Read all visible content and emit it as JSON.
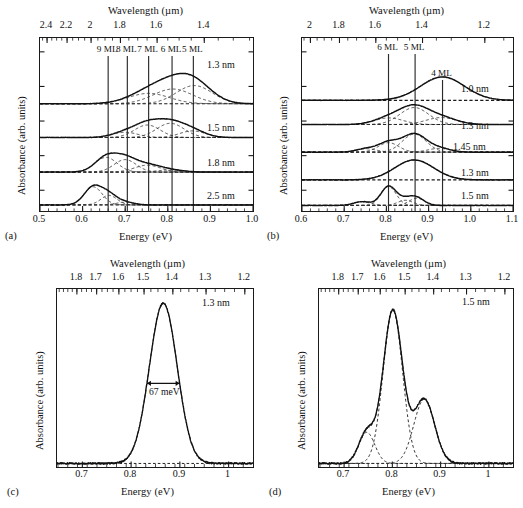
{
  "figure": {
    "axis_titles": {
      "wavelength": "Wavelength (µm)",
      "energy": "Energy (eV)",
      "absorbance": "Absorbance (arb. units)"
    },
    "panel_labels": {
      "a": "(a)",
      "b": "(b)",
      "c": "(c)",
      "d": "(d)"
    }
  },
  "chart_data": [
    {
      "panel": "a",
      "type": "line",
      "title": "",
      "xlabel": "Energy (eV)",
      "ylabel": "Absorbance (arb. units)",
      "top_axis_label": "Wavelength (µm)",
      "xlim": [
        0.5,
        1.0
      ],
      "xticks": [
        0.5,
        0.6,
        0.7,
        0.8,
        0.9,
        1.0
      ],
      "xticklabels": [
        "0.5",
        "0.6",
        "0.7",
        "0.8",
        "0.9",
        "1.0"
      ],
      "top_ticks_um": [
        2.4,
        2.2,
        2.0,
        1.8,
        1.6,
        1.4
      ],
      "top_ticklabels": [
        "2.4",
        "2.2",
        "2",
        "1.8",
        "1.6",
        "1.4"
      ],
      "grid": false,
      "legend_position": "right-inline",
      "marker_lines": [
        {
          "label": "9 ML",
          "energy": 0.66
        },
        {
          "label": "8 ML",
          "energy": 0.705
        },
        {
          "label": "7 ML",
          "energy": 0.755
        },
        {
          "label": "6 ML",
          "energy": 0.81
        },
        {
          "label": "5 ML",
          "energy": 0.86
        }
      ],
      "series": [
        {
          "name": "1.3 nm",
          "label": "1.3 nm",
          "baseline": 0.62,
          "components": [
            {
              "center": 0.755,
              "sigma": 0.048,
              "amp": 0.06
            },
            {
              "center": 0.812,
              "sigma": 0.046,
              "amp": 0.085
            },
            {
              "center": 0.862,
              "sigma": 0.042,
              "amp": 0.105
            }
          ]
        },
        {
          "name": "1.5 nm",
          "label": "1.5 nm",
          "baseline": 0.425,
          "components": [
            {
              "center": 0.7,
              "sigma": 0.03,
              "amp": 0.03
            },
            {
              "center": 0.752,
              "sigma": 0.03,
              "amp": 0.072
            },
            {
              "center": 0.806,
              "sigma": 0.032,
              "amp": 0.082
            },
            {
              "center": 0.858,
              "sigma": 0.03,
              "amp": 0.038
            }
          ]
        },
        {
          "name": "1.8 nm",
          "label": "1.8 nm",
          "baseline": 0.225,
          "components": [
            {
              "center": 0.655,
              "sigma": 0.026,
              "amp": 0.085
            },
            {
              "center": 0.7,
              "sigma": 0.026,
              "amp": 0.072
            },
            {
              "center": 0.752,
              "sigma": 0.03,
              "amp": 0.04
            },
            {
              "center": 0.805,
              "sigma": 0.03,
              "amp": 0.012
            }
          ]
        },
        {
          "name": "2.5 nm",
          "label": "2.5 nm",
          "baseline": 0.035,
          "components": [
            {
              "center": 0.625,
              "sigma": 0.021,
              "amp": 0.105
            },
            {
              "center": 0.662,
              "sigma": 0.019,
              "amp": 0.055
            },
            {
              "center": 0.7,
              "sigma": 0.02,
              "amp": 0.016
            }
          ]
        }
      ]
    },
    {
      "panel": "b",
      "type": "line",
      "title": "",
      "xlabel": "Energy (eV)",
      "ylabel": "Absorbance (arb. units)",
      "top_axis_label": "Wavelength (µm)",
      "xlim": [
        0.6,
        1.1
      ],
      "xticks": [
        0.6,
        0.7,
        0.8,
        0.9,
        1.0,
        1.1
      ],
      "xticklabels": [
        "0.6",
        "0.7",
        "0.8",
        "0.9",
        "1.0",
        "1.1"
      ],
      "top_ticks_um": [
        2.0,
        1.8,
        1.6,
        1.4,
        1.2
      ],
      "top_ticklabels": [
        "2",
        "1.8",
        "1.6",
        "1.4",
        "1.2"
      ],
      "grid": false,
      "legend_position": "right-inline",
      "marker_lines": [
        {
          "label": "6 ML",
          "energy": 0.805
        },
        {
          "label": "5 ML",
          "energy": 0.868
        },
        {
          "label": "4 ML",
          "energy": 0.933
        }
      ],
      "series": [
        {
          "name": "1.0 nm",
          "label": "1.0 nm",
          "baseline": 0.64,
          "components": [
            {
              "center": 0.933,
              "sigma": 0.052,
              "amp": 0.135
            }
          ]
        },
        {
          "name": "1.3 nm",
          "label": "1.3 nm",
          "baseline": 0.5,
          "components": [
            {
              "center": 0.806,
              "sigma": 0.034,
              "amp": 0.038
            },
            {
              "center": 0.866,
              "sigma": 0.034,
              "amp": 0.098
            },
            {
              "center": 0.93,
              "sigma": 0.036,
              "amp": 0.04
            }
          ]
        },
        {
          "name": "1.45 nm",
          "label": "1.45 nm",
          "baseline": 0.34,
          "components": [
            {
              "center": 0.752,
              "sigma": 0.024,
              "amp": 0.02
            },
            {
              "center": 0.805,
              "sigma": 0.024,
              "amp": 0.055
            },
            {
              "center": 0.866,
              "sigma": 0.028,
              "amp": 0.105
            },
            {
              "center": 0.925,
              "sigma": 0.026,
              "amp": 0.022
            }
          ]
        },
        {
          "name": "1.3 nm (lower)",
          "label": "1.3 nm",
          "baseline": 0.18,
          "components": [
            {
              "center": 0.866,
              "sigma": 0.046,
              "amp": 0.115
            }
          ]
        },
        {
          "name": "1.5 nm",
          "label": "1.5 nm",
          "baseline": 0.032,
          "components": [
            {
              "center": 0.742,
              "sigma": 0.02,
              "amp": 0.022
            },
            {
              "center": 0.805,
              "sigma": 0.018,
              "amp": 0.11
            },
            {
              "center": 0.845,
              "sigma": 0.018,
              "amp": 0.03
            },
            {
              "center": 0.872,
              "sigma": 0.018,
              "amp": 0.042
            }
          ]
        }
      ]
    },
    {
      "panel": "c",
      "type": "line",
      "title": "",
      "xlabel": "Energy (eV)",
      "ylabel": "Absorbance (arb. units)",
      "top_axis_label": "Wavelength (µm)",
      "xlim": [
        0.648,
        1.05
      ],
      "xticks": [
        0.7,
        0.8,
        0.9,
        1.0
      ],
      "xticklabels": [
        "0.7",
        "0.8",
        "0.9",
        "1"
      ],
      "top_ticks_um": [
        1.8,
        1.7,
        1.6,
        1.5,
        1.4,
        1.3,
        1.2
      ],
      "top_ticklabels": [
        "1.8",
        "1.7",
        "1.6",
        "1.5",
        "1.4",
        "1.3",
        "1.2"
      ],
      "grid": false,
      "nm_tag": "1.3 nm",
      "annotation": {
        "text": "67 meV",
        "center": 0.866,
        "fwhm_ev": 0.067
      },
      "series": [
        {
          "name": "measured",
          "label": "1.3 nm",
          "baseline": 0.02,
          "components": [
            {
              "center": 0.866,
              "sigma": 0.0285,
              "amp": 0.9
            }
          ]
        }
      ]
    },
    {
      "panel": "d",
      "type": "line",
      "title": "",
      "xlabel": "Energy (eV)",
      "ylabel": "Absorbance (arb. units)",
      "top_axis_label": "Wavelength (µm)",
      "xlim": [
        0.648,
        1.05
      ],
      "xticks": [
        0.7,
        0.8,
        0.9,
        1.0
      ],
      "xticklabels": [
        "0.7",
        "0.8",
        "0.9",
        "1"
      ],
      "top_ticks_um": [
        1.8,
        1.7,
        1.6,
        1.5,
        1.4,
        1.3,
        1.2
      ],
      "top_ticklabels": [
        "1.8",
        "1.7",
        "1.6",
        "1.5",
        "1.4",
        "1.3",
        "1.2"
      ],
      "grid": false,
      "nm_tag": "1.5 nm",
      "series": [
        {
          "name": "measured",
          "label": "1.5 nm",
          "baseline": 0.02,
          "components": [
            {
              "center": 0.747,
              "sigma": 0.0165,
              "amp": 0.175
            },
            {
              "center": 0.801,
              "sigma": 0.02,
              "amp": 0.86
            },
            {
              "center": 0.866,
              "sigma": 0.0215,
              "amp": 0.36
            }
          ]
        }
      ]
    }
  ]
}
